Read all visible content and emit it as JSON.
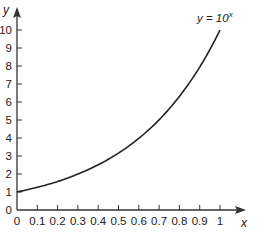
{
  "chart_data": {
    "type": "line",
    "title": "",
    "xlabel": "x",
    "ylabel": "y",
    "xlim": [
      0,
      1
    ],
    "ylim": [
      0,
      10
    ],
    "grid": false,
    "legend": "none",
    "x_ticks": [
      "0",
      "0.1",
      "0.2",
      "0.3",
      "0.4",
      "0.5",
      "0.6",
      "0.7",
      "0.8",
      "0.9",
      "1"
    ],
    "y_ticks": [
      "0",
      "1",
      "2",
      "3",
      "4",
      "5",
      "6",
      "7",
      "8",
      "9",
      "10"
    ],
    "annotations": [
      {
        "text": "y = 10",
        "superscript": "x",
        "position": "top-right"
      }
    ],
    "series": [
      {
        "name": "y = 10^x",
        "x": [
          0,
          0.1,
          0.2,
          0.3,
          0.4,
          0.5,
          0.6,
          0.7,
          0.8,
          0.9,
          1
        ],
        "values": [
          1,
          1.26,
          1.58,
          2.0,
          2.51,
          3.16,
          3.98,
          5.01,
          6.31,
          7.94,
          10
        ]
      }
    ]
  }
}
